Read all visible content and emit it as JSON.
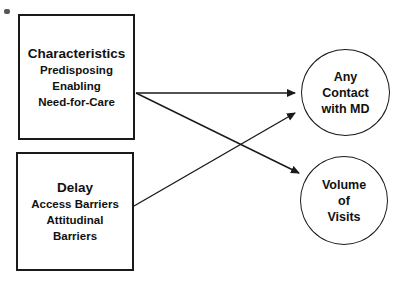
{
  "diagram": {
    "type": "path-model",
    "colors": {
      "background": "#ffffff",
      "line": "#1a1a1a",
      "text": "#111111"
    },
    "boxes": [
      {
        "id": "characteristics",
        "title": "Characteristics",
        "items": [
          "Predisposing",
          "Enabling",
          "Need-for-Care"
        ]
      },
      {
        "id": "delay",
        "title": "Delay",
        "items": [
          "Access Barriers",
          "Attitudinal",
          "Barriers"
        ]
      }
    ],
    "circles": [
      {
        "id": "any-contact-with-md",
        "lines": [
          "Any",
          "Contact",
          "with MD"
        ]
      },
      {
        "id": "volume-of-visits",
        "lines": [
          "Volume",
          "of",
          "Visits"
        ]
      }
    ],
    "arrows": [
      {
        "from": "Characteristics",
        "to": "Any Contact with MD"
      },
      {
        "from": "Characteristics",
        "to": "Volume of Visits"
      },
      {
        "from": "Delay",
        "to": "Any Contact with MD"
      }
    ]
  }
}
